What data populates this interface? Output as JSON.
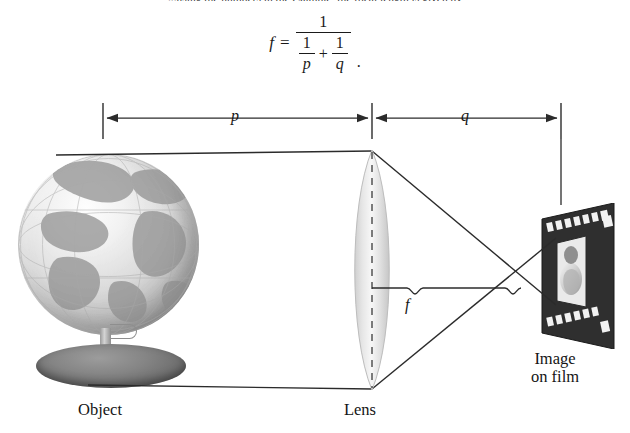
{
  "figure": {
    "title_cut_text": "...using the numbers in the example, the focal length is given by",
    "formula": {
      "lhs": "f",
      "equals": "=",
      "numerator": "1",
      "denominator_term1_num": "1",
      "denominator_term1_den": "p",
      "denominator_operator": "+",
      "denominator_term2_num": "1",
      "denominator_term2_den": "q",
      "terminator": "."
    },
    "dimensions": [
      {
        "name": "object-distance",
        "label": "p",
        "from_x": 103,
        "to_x": 372,
        "y": 118
      },
      {
        "name": "image-distance",
        "label": "q",
        "from_x": 372,
        "to_x": 561,
        "y": 118
      }
    ],
    "focal_length": {
      "label": "f",
      "from_x": 372,
      "to_x": 517,
      "y": 288
    },
    "captions": {
      "object": "Object",
      "lens": "Lens",
      "image_line1": "Image",
      "image_line2": "on film"
    },
    "colors": {
      "ink": "#1a1a1a",
      "line": "#2b2b2b",
      "lens_fill": "#dcdcdc",
      "film_dark": "#2a2a2a",
      "paper": "#ffffff"
    }
  }
}
